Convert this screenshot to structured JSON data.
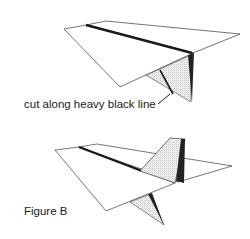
{
  "figure_a": {
    "caption": "cut along heavy black line"
  },
  "figure_b": {
    "caption": "Figure B"
  },
  "colors": {
    "outline": "#3a3a3a",
    "heavy_line": "#1a1a1a",
    "shade": "#e6e6e6",
    "dark_shade": "#222222",
    "background": "#ffffff"
  }
}
